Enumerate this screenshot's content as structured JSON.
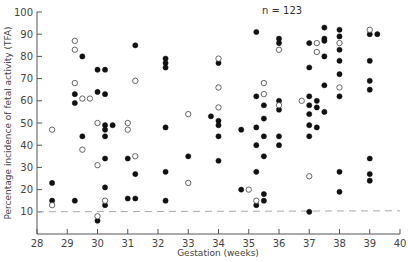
{
  "chart_data": {
    "type": "scatter",
    "title": "",
    "annotation": "n = 123",
    "xlabel": "Gestation (weeks)",
    "ylabel": "Percentage incidence of fetal activity (TFA)",
    "xlim": [
      28,
      40
    ],
    "ylim": [
      0,
      100
    ],
    "xticks": [
      28,
      29,
      30,
      31,
      32,
      33,
      34,
      35,
      36,
      37,
      38,
      39,
      40
    ],
    "yticks": [
      10,
      20,
      30,
      40,
      50,
      60,
      70,
      80,
      90,
      100
    ],
    "grid": false,
    "reference_line": {
      "y": 10,
      "style": "dashed",
      "color": "#aaaaaa"
    },
    "legend": "none",
    "series": [
      {
        "name": "filled",
        "marker": "filled-circle",
        "color": "#111111",
        "points": [
          [
            28.5,
            23
          ],
          [
            28.5,
            15
          ],
          [
            29.25,
            15
          ],
          [
            29.5,
            44
          ],
          [
            29.25,
            63
          ],
          [
            29.25,
            59
          ],
          [
            29.5,
            80
          ],
          [
            30.0,
            74
          ],
          [
            30.0,
            64
          ],
          [
            30.25,
            74
          ],
          [
            30.25,
            63
          ],
          [
            30.25,
            49
          ],
          [
            30.25,
            47
          ],
          [
            30.25,
            44
          ],
          [
            30.5,
            49
          ],
          [
            30.25,
            34
          ],
          [
            30.25,
            21
          ],
          [
            30.25,
            13
          ],
          [
            30.0,
            6
          ],
          [
            31.0,
            34
          ],
          [
            31.0,
            16
          ],
          [
            31.25,
            16
          ],
          [
            31.25,
            27
          ],
          [
            31.25,
            85
          ],
          [
            32.25,
            79
          ],
          [
            32.25,
            77
          ],
          [
            32.25,
            75
          ],
          [
            32.25,
            48
          ],
          [
            32.25,
            28
          ],
          [
            32.25,
            15
          ],
          [
            33.0,
            35
          ],
          [
            33.75,
            53
          ],
          [
            34.0,
            77
          ],
          [
            34.0,
            51
          ],
          [
            34.0,
            49
          ],
          [
            34.0,
            44
          ],
          [
            34.0,
            33
          ],
          [
            34.75,
            47
          ],
          [
            34.75,
            20
          ],
          [
            35.25,
            91
          ],
          [
            35.25,
            62
          ],
          [
            35.25,
            48
          ],
          [
            35.25,
            40
          ],
          [
            35.25,
            28
          ],
          [
            35.25,
            13
          ],
          [
            35.5,
            58
          ],
          [
            35.5,
            52
          ],
          [
            35.5,
            44
          ],
          [
            35.5,
            35
          ],
          [
            35.5,
            18
          ],
          [
            35.5,
            15
          ],
          [
            36.0,
            86
          ],
          [
            36.0,
            88
          ],
          [
            36.0,
            60
          ],
          [
            36.0,
            56
          ],
          [
            36.0,
            44
          ],
          [
            36.0,
            40
          ],
          [
            37.0,
            86
          ],
          [
            37.0,
            75
          ],
          [
            37.0,
            62
          ],
          [
            37.0,
            58
          ],
          [
            37.0,
            54
          ],
          [
            37.0,
            49
          ],
          [
            37.0,
            44
          ],
          [
            37.0,
            10
          ],
          [
            37.25,
            60
          ],
          [
            37.25,
            57
          ],
          [
            37.25,
            48
          ],
          [
            37.5,
            93
          ],
          [
            37.5,
            87
          ],
          [
            37.5,
            88
          ],
          [
            37.5,
            80
          ],
          [
            37.5,
            67
          ],
          [
            37.5,
            55
          ],
          [
            38.0,
            92
          ],
          [
            38.0,
            89
          ],
          [
            38.0,
            83
          ],
          [
            38.0,
            78
          ],
          [
            38.0,
            72
          ],
          [
            38.0,
            62
          ],
          [
            38.0,
            28
          ],
          [
            38.0,
            19
          ],
          [
            39.0,
            90
          ],
          [
            39.0,
            78
          ],
          [
            39.0,
            69
          ],
          [
            39.0,
            65
          ],
          [
            39.0,
            34
          ],
          [
            39.0,
            27
          ],
          [
            39.0,
            24
          ],
          [
            39.25,
            90
          ]
        ]
      },
      {
        "name": "open",
        "marker": "open-circle",
        "color": "#555555",
        "points": [
          [
            28.5,
            47
          ],
          [
            28.5,
            13
          ],
          [
            29.25,
            87
          ],
          [
            29.25,
            83
          ],
          [
            29.25,
            68
          ],
          [
            29.5,
            61
          ],
          [
            29.75,
            61
          ],
          [
            29.5,
            38
          ],
          [
            30.0,
            50
          ],
          [
            30.0,
            31
          ],
          [
            30.0,
            8
          ],
          [
            30.25,
            15
          ],
          [
            31.0,
            50
          ],
          [
            31.0,
            47
          ],
          [
            31.25,
            35
          ],
          [
            31.25,
            69
          ],
          [
            33.0,
            54
          ],
          [
            33.0,
            23
          ],
          [
            34.0,
            79
          ],
          [
            34.0,
            66
          ],
          [
            34.0,
            57
          ],
          [
            35.0,
            20
          ],
          [
            35.25,
            15
          ],
          [
            35.5,
            68
          ],
          [
            35.5,
            63
          ],
          [
            36.0,
            83
          ],
          [
            36.0,
            58
          ],
          [
            36.75,
            60
          ],
          [
            37.0,
            26
          ],
          [
            37.25,
            86
          ],
          [
            37.25,
            82
          ],
          [
            38.0,
            66
          ],
          [
            38.0,
            86
          ],
          [
            39.0,
            92
          ]
        ]
      }
    ]
  }
}
